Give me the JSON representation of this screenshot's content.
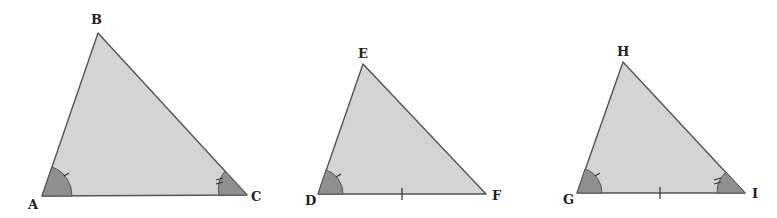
{
  "diagram": {
    "colors": {
      "fill": "#d4d4d4",
      "angle_fill": "#8f8f8f",
      "stroke": "#555555"
    },
    "triangles": [
      {
        "name": "ABC",
        "vertices": {
          "A": [
            42,
            196
          ],
          "B": [
            98,
            33
          ],
          "C": [
            247,
            195
          ]
        },
        "labels": {
          "A": "A",
          "B": "B",
          "C": "C"
        },
        "angle_marks": [
          {
            "vertex": "A",
            "ticks": 1
          },
          {
            "vertex": "C",
            "ticks": 2
          }
        ],
        "side_marks": []
      },
      {
        "name": "DEF",
        "vertices": {
          "D": [
            318,
            194
          ],
          "E": [
            363,
            64
          ],
          "F": [
            486,
            194
          ]
        },
        "labels": {
          "D": "D",
          "E": "E",
          "F": "F"
        },
        "angle_marks": [
          {
            "vertex": "D",
            "ticks": 1
          }
        ],
        "side_marks": [
          {
            "side": "DF",
            "ticks": 1
          }
        ]
      },
      {
        "name": "GHI",
        "vertices": {
          "G": [
            577,
            193
          ],
          "H": [
            623,
            62
          ],
          "I": [
            745,
            193
          ]
        },
        "labels": {
          "G": "G",
          "H": "H",
          "I": "I"
        },
        "angle_marks": [
          {
            "vertex": "G",
            "ticks": 1
          },
          {
            "vertex": "I",
            "ticks": 2
          }
        ],
        "side_marks": [
          {
            "side": "GI",
            "ticks": 1
          }
        ]
      }
    ]
  }
}
